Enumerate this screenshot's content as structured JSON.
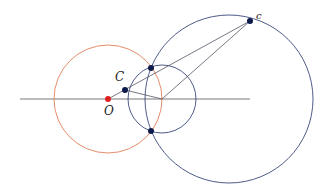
{
  "diagram": {
    "colors": {
      "axis": "#555555",
      "orange_circle": "#e0805a",
      "blue_circle": "#3a4a7a",
      "lines": "#555566",
      "point": "#0d1a4a",
      "origin_point": "#e02020"
    },
    "labels": {
      "O": "O",
      "C": "C",
      "c": "c"
    },
    "axis": {
      "x1": 20,
      "y1": 99,
      "x2": 250,
      "y2": 99
    },
    "circles": [
      {
        "name": "orange-circle",
        "cx": 108,
        "cy": 99,
        "r": 54,
        "color": "#e0805a"
      },
      {
        "name": "small-blue-circle",
        "cx": 162,
        "cy": 99,
        "r": 34,
        "color": "#3a4a7a"
      },
      {
        "name": "large-blue-circle",
        "cx": 229,
        "cy": 99,
        "r": 84,
        "color": "#3a4a7a"
      }
    ],
    "points": [
      {
        "name": "O",
        "x": 108,
        "y": 99,
        "color": "#e02020"
      },
      {
        "name": "C",
        "x": 125,
        "y": 90,
        "color": "#0d1a4a"
      },
      {
        "name": "top-intersection",
        "x": 151,
        "y": 68,
        "color": "#0d1a4a"
      },
      {
        "name": "bottom-intersection",
        "x": 151,
        "y": 131,
        "color": "#0d1a4a"
      },
      {
        "name": "c",
        "x": 250,
        "y": 21,
        "color": "#0d1a4a"
      }
    ],
    "segments": [
      {
        "name": "O-to-c",
        "x1": 108,
        "y1": 99,
        "x2": 250,
        "y2": 21
      },
      {
        "name": "C-to-center",
        "x1": 125,
        "y1": 90,
        "x2": 162,
        "y2": 99
      },
      {
        "name": "center-to-c",
        "x1": 162,
        "y1": 99,
        "x2": 250,
        "y2": 21
      }
    ]
  }
}
